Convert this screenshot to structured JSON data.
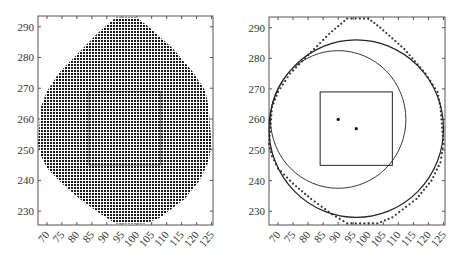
{
  "chart_data": [
    {
      "type": "scatter",
      "title": "",
      "description": "Dense grid of sample points filling an irregular octagon-like region, with a faint inner square",
      "xlabel": "",
      "ylabel": "",
      "xlim": [
        67,
        125.5
      ],
      "ylim": [
        225.5,
        293.5
      ],
      "x_ticks": [
        70,
        75,
        80,
        85,
        90,
        95,
        100,
        105,
        110,
        115,
        120,
        125
      ],
      "y_ticks": [
        230,
        240,
        250,
        260,
        270,
        280,
        290
      ],
      "grid": false,
      "grid_point_spacing": 1,
      "region_boundary": [
        [
          93,
          293
        ],
        [
          100,
          293
        ],
        [
          104,
          290
        ],
        [
          112,
          283
        ],
        [
          119,
          275
        ],
        [
          123,
          269
        ],
        [
          124,
          264
        ],
        [
          125,
          252
        ],
        [
          124,
          246
        ],
        [
          121,
          240
        ],
        [
          116,
          234
        ],
        [
          108,
          228
        ],
        [
          103,
          226
        ],
        [
          93,
          226
        ],
        [
          88,
          229
        ],
        [
          81,
          234
        ],
        [
          75,
          239
        ],
        [
          70,
          244
        ],
        [
          68,
          248
        ],
        [
          67,
          252
        ],
        [
          68,
          264
        ],
        [
          70,
          269
        ],
        [
          74,
          275
        ],
        [
          80,
          281
        ],
        [
          87,
          288
        ]
      ],
      "inner_square": {
        "x": [
          84,
          108
        ],
        "y": [
          245,
          269
        ]
      }
    },
    {
      "type": "scatter",
      "title": "",
      "description": "Boundary points of the region with a fitted large circle, a smaller circle, a square and two center points",
      "xlabel": "",
      "ylabel": "",
      "xlim": [
        67,
        125.5
      ],
      "ylim": [
        225.5,
        293.5
      ],
      "x_ticks": [
        70,
        75,
        80,
        85,
        90,
        95,
        100,
        105,
        110,
        115,
        120,
        125
      ],
      "y_ticks": [
        230,
        240,
        250,
        260,
        270,
        280,
        290
      ],
      "grid": false,
      "boundary_points": [
        [
          93,
          293
        ],
        [
          100,
          293
        ],
        [
          104,
          290
        ],
        [
          112,
          283
        ],
        [
          119,
          275
        ],
        [
          123,
          269
        ],
        [
          124,
          264
        ],
        [
          125,
          252
        ],
        [
          124,
          246
        ],
        [
          121,
          240
        ],
        [
          116,
          234
        ],
        [
          108,
          228
        ],
        [
          103,
          226
        ],
        [
          93,
          226
        ],
        [
          88,
          229
        ],
        [
          81,
          234
        ],
        [
          75,
          239
        ],
        [
          70,
          244
        ],
        [
          68,
          248
        ],
        [
          67,
          252
        ],
        [
          68,
          264
        ],
        [
          70,
          269
        ],
        [
          74,
          275
        ],
        [
          80,
          281
        ],
        [
          87,
          288
        ]
      ],
      "circles": [
        {
          "name": "large circle",
          "center": [
            96,
            257
          ],
          "radius": 29
        },
        {
          "name": "small circle",
          "center": [
            90,
            260
          ],
          "radius": 22.5
        }
      ],
      "square": {
        "x": [
          84,
          108
        ],
        "y": [
          245,
          269
        ]
      },
      "points": [
        {
          "name": "center 1",
          "x": 90,
          "y": 260
        },
        {
          "name": "center 2",
          "x": 96,
          "y": 257
        }
      ]
    }
  ],
  "axes": {
    "x_tick_labels": [
      "70",
      "75",
      "80",
      "85",
      "90",
      "95",
      "100",
      "105",
      "110",
      "115",
      "120",
      "125"
    ],
    "y_tick_labels": [
      "290",
      "280",
      "270",
      "260",
      "250",
      "240",
      "230"
    ]
  },
  "colors": {
    "ink": "#222222",
    "axis": "#555555",
    "fill_dots": "#1a1a1a"
  }
}
